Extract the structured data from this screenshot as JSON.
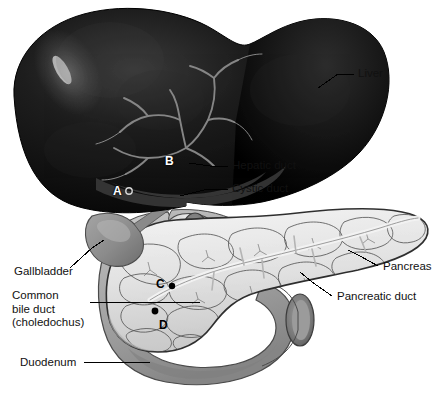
{
  "figure": {
    "background_color": "#ffffff"
  },
  "labels": [
    {
      "id": "liver",
      "text": "Liver",
      "x": 358,
      "y": 68,
      "multiline": false
    },
    {
      "id": "hepatic-duct",
      "text": "Hepatic duct",
      "x": 232,
      "y": 163,
      "multiline": false
    },
    {
      "id": "cystic-duct",
      "text": "Cystic duct",
      "x": 232,
      "y": 185,
      "multiline": false
    },
    {
      "id": "gallbladder",
      "text": "Gallbladder",
      "x": 14,
      "y": 266,
      "multiline": false
    },
    {
      "id": "common-bile-duct",
      "text": "Common bile duct (choledochus)",
      "x": 12,
      "y": 290,
      "multiline": true
    },
    {
      "id": "duodenum",
      "text": "Duodenum",
      "x": 20,
      "y": 359,
      "multiline": false
    },
    {
      "id": "pancreas",
      "text": "Pancreas",
      "x": 383,
      "y": 262,
      "multiline": false
    },
    {
      "id": "pancreatic-duct",
      "text": "Pancreatic duct",
      "x": 337,
      "y": 292,
      "multiline": false
    }
  ],
  "common_bile_duct_lines": [
    "Common",
    "bile duct",
    "(choledochus)"
  ],
  "markers": [
    {
      "id": "A",
      "text": "A",
      "x": 113,
      "y": 190,
      "style": "light",
      "dot": "open",
      "dot_x": 129,
      "dot_y": 192
    },
    {
      "id": "B",
      "text": "B",
      "x": 165,
      "y": 160,
      "style": "light",
      "dot": "none",
      "dot_x": 0,
      "dot_y": 0
    },
    {
      "id": "C",
      "text": "C",
      "x": 156,
      "y": 283,
      "style": "dark",
      "dot": "filled",
      "dot_x": 172,
      "dot_y": 286
    },
    {
      "id": "D",
      "text": "D",
      "x": 159,
      "y": 324,
      "style": "dark",
      "dot": "filled",
      "dot_x": 155,
      "dot_y": 311
    }
  ],
  "colors": {
    "liver": "#111111",
    "liver_highlight": "#555555",
    "vessel": "#8a8a8a",
    "gallbladder": "#8e8e8e",
    "duodenum": "#a8a8a8",
    "duodenum_shadow": "#8c8c8c",
    "pancreas": "#e3e3e3",
    "pancreas_outline": "#3a3a3a",
    "duct": "#d8d8d8",
    "leader_line": "#000000",
    "text": "#111111"
  },
  "leader_lines": [
    {
      "id": "liver-leader",
      "from_x": 318,
      "to_x": 352
    },
    {
      "id": "hepatic-duct-leader",
      "from_x": 190,
      "to_x": 228
    },
    {
      "id": "cystic-duct-leader",
      "from_x": 186,
      "to_x": 228
    },
    {
      "id": "gallbladder-leader",
      "from_x": 74,
      "to_x": 110
    },
    {
      "id": "common-bile-duct-leader",
      "from_x": 88,
      "to_x": 200
    },
    {
      "id": "duodenum-leader",
      "from_x": 82,
      "to_x": 148
    },
    {
      "id": "pancreas-leader",
      "from_x": 352,
      "to_x": 378
    },
    {
      "id": "pancreatic-duct-leader",
      "from_x": 300,
      "to_x": 332
    }
  ]
}
